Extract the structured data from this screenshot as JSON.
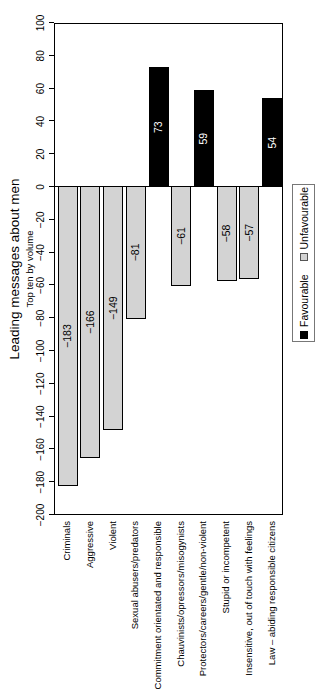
{
  "chart_data": {
    "type": "bar",
    "title": "Leading messages about men",
    "subtitle": "Top ten by volume",
    "orientation": "horizontal bars in a landscape figure, whole figure rotated 90 degrees counter-clockwise",
    "value_axis": {
      "min": -200,
      "max": 100,
      "tick_step": 20,
      "tick_labels": [
        "-200",
        "-180",
        "-160",
        "-140",
        "-120",
        "-100",
        "-80",
        "-60",
        "-40",
        "-20",
        "0",
        "20",
        "40",
        "60",
        "80",
        "100"
      ]
    },
    "categories": [
      "Criminals",
      "Aggressive",
      "Violent",
      "Sexual abusers/predators",
      "Commitment orientated and responsible",
      "Chauvinists/opressors/misogynists",
      "Protectors/careers/gentle/non-violent",
      "Stupid or incompetent",
      "Insensitive, out of touch with feelings",
      "Law – abiding responsible citizens"
    ],
    "values": [
      -183,
      -166,
      -149,
      -81,
      73,
      -61,
      59,
      -58,
      -57,
      54
    ],
    "bar_value_labels": [
      "-183",
      "-166",
      "-149",
      "-81",
      "73",
      "-61",
      "59",
      "-58",
      "-57",
      "54"
    ],
    "series": [
      {
        "name": "Favourable",
        "color": "#000000",
        "values": [
          null,
          null,
          null,
          null,
          73,
          null,
          59,
          null,
          null,
          54
        ]
      },
      {
        "name": "Unfavourable",
        "color": "#d3d3d3",
        "values": [
          -183,
          -166,
          -149,
          -81,
          null,
          -61,
          null,
          -58,
          -57,
          null
        ]
      }
    ],
    "legend": {
      "position": "bottom-center",
      "items": [
        {
          "label": "Favourable",
          "fill": "#000000"
        },
        {
          "label": "Unfavourable",
          "fill": "#d3d3d3"
        }
      ]
    },
    "grid": false,
    "colors": {
      "favourable_bar": "#000000",
      "unfavourable_bar": "#d3d3d3",
      "bar_border": "#000000",
      "label_on_favourable": "#ffffff",
      "label_on_unfavourable": "#000000",
      "background": "#ffffff"
    }
  }
}
